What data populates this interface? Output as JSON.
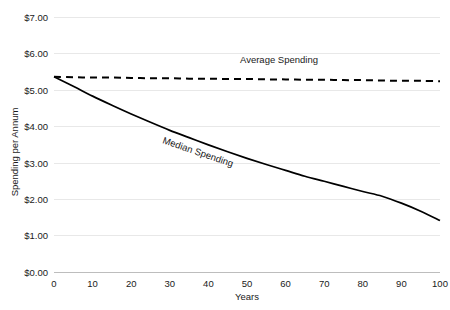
{
  "chart_data": {
    "type": "line",
    "title": "",
    "xlabel": "Years",
    "ylabel": "Spending per Annum",
    "xlim": [
      0,
      100
    ],
    "ylim": [
      0,
      7
    ],
    "grid": true,
    "legend_position": "inline-labels",
    "x_ticks": [
      "0",
      "10",
      "20",
      "30",
      "40",
      "50",
      "60",
      "70",
      "80",
      "90",
      "100"
    ],
    "y_ticks": [
      "$0.00",
      "$1.00",
      "$2.00",
      "$3.00",
      "$4.00",
      "$5.00",
      "$6.00",
      "$7.00"
    ],
    "x": [
      0,
      5,
      10,
      15,
      20,
      25,
      30,
      35,
      40,
      45,
      50,
      55,
      60,
      65,
      70,
      75,
      80,
      85,
      90,
      95,
      100
    ],
    "series": [
      {
        "name": "Average Spending",
        "style": "dashed",
        "color": "#000000",
        "values": [
          5.37,
          5.36,
          5.35,
          5.35,
          5.34,
          5.33,
          5.33,
          5.32,
          5.32,
          5.31,
          5.31,
          5.3,
          5.3,
          5.29,
          5.29,
          5.28,
          5.28,
          5.27,
          5.26,
          5.26,
          5.25
        ]
      },
      {
        "name": "Median Spending",
        "style": "solid",
        "color": "#000000",
        "values": [
          5.37,
          5.11,
          4.84,
          4.59,
          4.35,
          4.12,
          3.9,
          3.7,
          3.5,
          3.31,
          3.13,
          2.96,
          2.8,
          2.64,
          2.5,
          2.36,
          2.22,
          2.09,
          1.9,
          1.68,
          1.42
        ]
      }
    ],
    "annotations": [
      {
        "name": "average-spending-label",
        "text": "Average Spending",
        "x": 50,
        "y": 5.77,
        "rotation": 0
      },
      {
        "name": "median-spending-label",
        "text": "Median Spending",
        "x": 37,
        "y": 3.7,
        "rotation": 19
      }
    ]
  },
  "axes": {
    "y_title": "Spending per Annum",
    "x_title": "Years"
  }
}
